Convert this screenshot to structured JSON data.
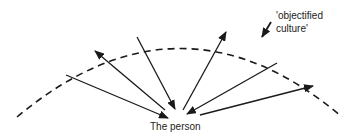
{
  "diagram": {
    "center_label": "The person",
    "arc_label_line1": "'objectified",
    "arc_label_line2": "culture'",
    "colors": {
      "stroke": "#1a1a1a",
      "text": "#222222",
      "background": "#ffffff"
    },
    "arc": {
      "style": "dashed",
      "start": [
        17,
        117
      ],
      "control": [
        181,
        -20
      ],
      "end": [
        342,
        117
      ]
    },
    "arrows": [
      {
        "from": [
          66,
          75
        ],
        "to": [
          168,
          118
        ],
        "direction": "to-person"
      },
      {
        "from": [
          165,
          110
        ],
        "to": [
          95,
          51
        ],
        "direction": "to-culture"
      },
      {
        "from": [
          137,
          37
        ],
        "to": [
          175,
          109
        ],
        "direction": "to-person"
      },
      {
        "from": [
          183,
          110
        ],
        "to": [
          226,
          32
        ],
        "direction": "to-culture"
      },
      {
        "from": [
          277,
          63
        ],
        "to": [
          187,
          114
        ],
        "direction": "to-person"
      },
      {
        "from": [
          200,
          115
        ],
        "to": [
          313,
          86
        ],
        "direction": "to-culture"
      }
    ],
    "label_pointer": {
      "from": [
        271,
        22
      ],
      "to": [
        262,
        37
      ]
    }
  }
}
